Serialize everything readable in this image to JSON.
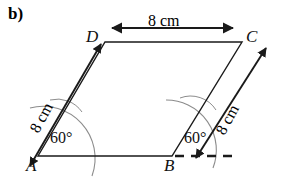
{
  "figure": {
    "part_label": "b)",
    "shape": "parallelogram",
    "vertices": [
      {
        "name": "A",
        "x": 38,
        "y": 156,
        "label_x": 26,
        "label_y": 158
      },
      {
        "name": "B",
        "x": 172,
        "y": 156,
        "label_x": 166,
        "label_y": 158
      },
      {
        "name": "C",
        "x": 242,
        "y": 42,
        "label_x": 246,
        "label_y": 30
      },
      {
        "name": "D",
        "x": 105,
        "y": 42,
        "label_x": 88,
        "label_y": 30
      }
    ],
    "dimensions": [
      {
        "id": "top-dimension",
        "text": "8 cm",
        "side": "DC",
        "value": 8,
        "unit": "cm"
      },
      {
        "id": "left-dimension",
        "text": "8 cm",
        "side": "AD",
        "value": 8,
        "unit": "cm"
      },
      {
        "id": "right-dimension",
        "text": "8 cm",
        "side": "BC",
        "value": 8,
        "unit": "cm"
      }
    ],
    "angles": [
      {
        "id": "angle-at-a",
        "text": "60°",
        "vertex": "A",
        "value": 60,
        "unit": "degrees"
      },
      {
        "id": "angle-at-b",
        "text": "60°",
        "vertex": "B",
        "value": 60,
        "unit": "degrees"
      }
    ],
    "extension_line": {
      "id": "dashed-baseline-extension",
      "style": "dashed",
      "from": "B",
      "direction": "right"
    },
    "construction_arcs": {
      "count": 2,
      "color": "#8a8a8a",
      "note": "compass arcs at A and B"
    },
    "colors": {
      "stroke": "#1a1a1a",
      "arc": "#8c8c8c",
      "background": "#ffffff",
      "text": "#111111"
    }
  }
}
